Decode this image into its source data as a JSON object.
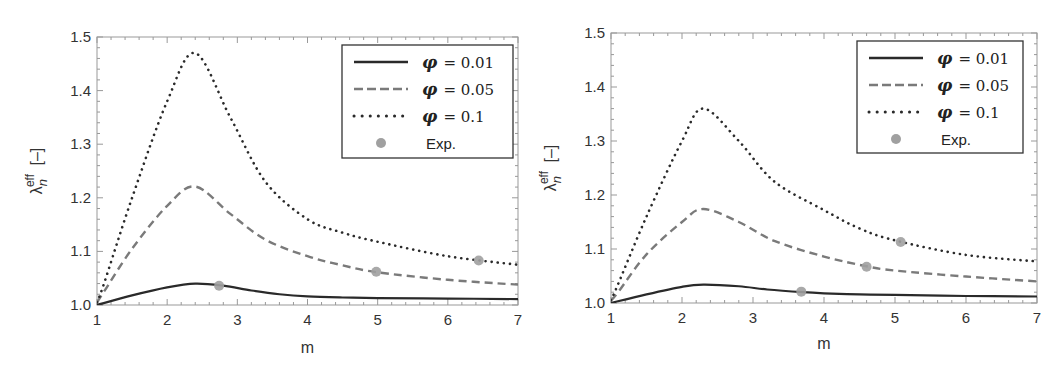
{
  "chart_data": [
    {
      "type": "line",
      "panel": "left",
      "title": "",
      "xlabel": "m",
      "ylabel": "λ_n^eff [–]",
      "ylabel_parts": {
        "symbol": "λ",
        "sub": "n",
        "sup": "eff",
        "unit": "[–]"
      },
      "xlim": [
        1,
        7
      ],
      "ylim": [
        1.0,
        1.5
      ],
      "xticks": [
        "1",
        "2",
        "3",
        "4",
        "5",
        "6",
        "7"
      ],
      "yticks": [
        "1.0",
        "1.1",
        "1.2",
        "1.3",
        "1.4",
        "1.5"
      ],
      "grid": false,
      "legend_position": "top-right",
      "series": [
        {
          "name": "φ = 0.01",
          "legend_symbol": "φ",
          "legend_value": "= 0.01",
          "style": "solid",
          "color": "#2a2a2a",
          "x": [
            1.0,
            1.5,
            2.0,
            2.4,
            2.8,
            3.2,
            3.6,
            4.0,
            4.5,
            5.0,
            6.0,
            7.0
          ],
          "y": [
            1.0,
            1.018,
            1.033,
            1.04,
            1.036,
            1.027,
            1.02,
            1.016,
            1.014,
            1.013,
            1.012,
            1.011
          ]
        },
        {
          "name": "φ = 0.05",
          "legend_symbol": "φ",
          "legend_value": "= 0.05",
          "style": "dashed",
          "color": "#7a7a7a",
          "x": [
            1.0,
            1.1,
            1.5,
            2.0,
            2.4,
            2.9,
            3.4,
            4.0,
            4.5,
            5.0,
            6.0,
            7.0
          ],
          "y": [
            1.005,
            1.025,
            1.105,
            1.185,
            1.221,
            1.17,
            1.122,
            1.091,
            1.074,
            1.061,
            1.047,
            1.038
          ]
        },
        {
          "name": "φ = 0.1",
          "legend_symbol": "φ",
          "legend_value": "= 0.1",
          "style": "dotted",
          "color": "#2a2a2a",
          "x": [
            1.0,
            1.1,
            1.5,
            2.0,
            2.4,
            2.9,
            3.4,
            4.0,
            4.5,
            5.0,
            6.0,
            7.0
          ],
          "y": [
            1.005,
            1.04,
            1.2,
            1.38,
            1.47,
            1.35,
            1.23,
            1.16,
            1.135,
            1.118,
            1.091,
            1.075
          ]
        },
        {
          "name": "Exp.",
          "legend_value": "Exp.",
          "style": "markers",
          "color": "#a0a0a0",
          "x": [
            2.74,
            4.98,
            6.44
          ],
          "y": [
            1.036,
            1.062,
            1.083
          ]
        }
      ]
    },
    {
      "type": "line",
      "panel": "right",
      "title": "",
      "xlabel": "m",
      "ylabel": "λ_n^eff [–]",
      "ylabel_parts": {
        "symbol": "λ",
        "sub": "n",
        "sup": "eff",
        "unit": "[–]"
      },
      "xlim": [
        1,
        7
      ],
      "ylim": [
        1.0,
        1.5
      ],
      "xticks": [
        "1",
        "2",
        "3",
        "4",
        "5",
        "6",
        "7"
      ],
      "yticks": [
        "1.0",
        "1.1",
        "1.2",
        "1.3",
        "1.4",
        "1.5"
      ],
      "grid": false,
      "legend_position": "top-right",
      "series": [
        {
          "name": "φ = 0.01",
          "legend_symbol": "φ",
          "legend_value": "= 0.01",
          "style": "solid",
          "color": "#2a2a2a",
          "x": [
            1.0,
            1.5,
            2.0,
            2.3,
            2.8,
            3.2,
            3.7,
            4.0,
            4.5,
            5.0,
            6.0,
            7.0
          ],
          "y": [
            1.0,
            1.016,
            1.03,
            1.034,
            1.031,
            1.025,
            1.02,
            1.018,
            1.016,
            1.015,
            1.013,
            1.012
          ]
        },
        {
          "name": "φ = 0.05",
          "legend_symbol": "φ",
          "legend_value": "= 0.05",
          "style": "dashed",
          "color": "#7a7a7a",
          "x": [
            1.0,
            1.1,
            1.5,
            2.0,
            2.3,
            2.8,
            3.3,
            4.0,
            4.6,
            5.0,
            6.0,
            7.0
          ],
          "y": [
            1.005,
            1.02,
            1.09,
            1.15,
            1.174,
            1.15,
            1.115,
            1.086,
            1.068,
            1.06,
            1.049,
            1.04
          ]
        },
        {
          "name": "φ = 0.1",
          "legend_symbol": "φ",
          "legend_value": "= 0.1",
          "style": "dotted",
          "color": "#2a2a2a",
          "x": [
            1.0,
            1.1,
            1.5,
            2.0,
            2.3,
            2.8,
            3.3,
            4.0,
            4.5,
            5.0,
            6.0,
            7.0
          ],
          "y": [
            1.005,
            1.035,
            1.16,
            1.3,
            1.36,
            1.3,
            1.225,
            1.172,
            1.138,
            1.116,
            1.089,
            1.077
          ]
        },
        {
          "name": "Exp.",
          "legend_value": "Exp.",
          "style": "markers",
          "color": "#a0a0a0",
          "x": [
            3.68,
            4.6,
            5.08
          ],
          "y": [
            1.021,
            1.067,
            1.113
          ]
        }
      ]
    }
  ]
}
